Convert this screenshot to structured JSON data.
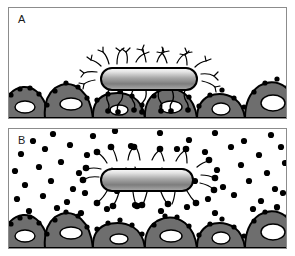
{
  "figure": {
    "background_color": "#ffffff",
    "width": 295,
    "height": 256
  },
  "colors": {
    "outline": "#000000",
    "panel_border": "#8c8c8c",
    "cell_fill": "#6e6e6e",
    "cell_fill_dark": "#595959",
    "nucleus_fill": "#ffffff",
    "receptor_dot": "#000000",
    "bacterium_light": "#f2f2f2",
    "bacterium_mid": "#9e9e9e",
    "bacterium_dark": "#5a5a5a",
    "free_inhibitor": "#000000",
    "label_text": "#1a1a1a"
  },
  "panels": [
    {
      "id": "A",
      "label": "A",
      "caption_text": "A",
      "description": "Bacterium with branched fimbriae attached to the epithelial cell surface receptors",
      "bacterium": {
        "center_x": 139,
        "center_y": 81,
        "body_width": 96,
        "body_height": 22,
        "attached": true
      },
      "free_inhibitors_count": 0,
      "cells": [
        {
          "cx": 18,
          "cy": 118,
          "rx": 26,
          "ry": 18,
          "nucleus_cx": 16,
          "nucleus_cy": 114,
          "nucleus_rx": 9,
          "nucleus_ry": 5
        },
        {
          "cx": 68,
          "cy": 118,
          "rx": 28,
          "ry": 20,
          "nucleus_cx": 66,
          "nucleus_cy": 113,
          "nucleus_rx": 10,
          "nucleus_ry": 5
        },
        {
          "cx": 122,
          "cy": 118,
          "rx": 28,
          "ry": 16,
          "nucleus_cx": 120,
          "nucleus_cy": 115,
          "nucleus_rx": 8,
          "nucleus_ry": 4
        },
        {
          "cx": 172,
          "cy": 118,
          "rx": 26,
          "ry": 20,
          "nucleus_cx": 170,
          "nucleus_cy": 113,
          "nucleus_rx": 10,
          "nucleus_ry": 6
        },
        {
          "cx": 222,
          "cy": 118,
          "rx": 26,
          "ry": 17,
          "nucleus_cx": 221,
          "nucleus_cy": 114,
          "nucleus_rx": 9,
          "nucleus_ry": 5
        },
        {
          "cx": 266,
          "cy": 118,
          "rx": 26,
          "ry": 22,
          "nucleus_cx": 264,
          "nucleus_cy": 112,
          "nucleus_rx": 11,
          "nucleus_ry": 7
        }
      ]
    },
    {
      "id": "B",
      "label": "B",
      "caption_text": "B",
      "description": "Bacterium detached from the epithelium, its fimbrial tips blocked by free soluble receptor analogues dispersed in the medium",
      "bacterium": {
        "center_x": 139,
        "center_y": 177,
        "body_width": 92,
        "body_height": 22,
        "attached": false
      },
      "free_inhibitors_count": 62,
      "cells": [
        {
          "cx": 18,
          "cy": 248,
          "rx": 26,
          "ry": 20,
          "nucleus_cx": 16,
          "nucleus_cy": 243,
          "nucleus_rx": 9,
          "nucleus_ry": 5
        },
        {
          "cx": 68,
          "cy": 248,
          "rx": 28,
          "ry": 21,
          "nucleus_cx": 66,
          "nucleus_cy": 242,
          "nucleus_rx": 10,
          "nucleus_ry": 5
        },
        {
          "cx": 122,
          "cy": 248,
          "rx": 28,
          "ry": 17,
          "nucleus_cx": 120,
          "nucleus_cy": 245,
          "nucleus_rx": 8,
          "nucleus_ry": 4
        },
        {
          "cx": 172,
          "cy": 248,
          "rx": 26,
          "ry": 21,
          "nucleus_cx": 170,
          "nucleus_cy": 243,
          "nucleus_rx": 10,
          "nucleus_ry": 6
        },
        {
          "cx": 222,
          "cy": 248,
          "rx": 26,
          "ry": 18,
          "nucleus_cx": 221,
          "nucleus_cy": 244,
          "nucleus_rx": 9,
          "nucleus_ry": 5
        },
        {
          "cx": 266,
          "cy": 248,
          "rx": 26,
          "ry": 23,
          "nucleus_cx": 264,
          "nucleus_cy": 241,
          "nucleus_rx": 11,
          "nucleus_ry": 7
        }
      ]
    }
  ],
  "legend_items": [
    {
      "name": "bacterium",
      "label": "Bacterium"
    },
    {
      "name": "fimbria",
      "label": "Fimbria"
    },
    {
      "name": "receptor",
      "label": "Surface receptor"
    },
    {
      "name": "epithelial-cell",
      "label": "Epithelial cell"
    },
    {
      "name": "soluble-inhibitor",
      "label": "Soluble receptor analogue"
    }
  ]
}
